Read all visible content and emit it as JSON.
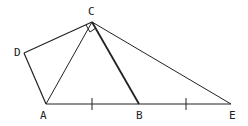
{
  "diagram": {
    "type": "geometry",
    "points": {
      "A": {
        "label": "A",
        "x": 46,
        "y": 104,
        "lx": 42,
        "ly": 119
      },
      "B": {
        "label": "B",
        "x": 139,
        "y": 104,
        "lx": 136,
        "ly": 119
      },
      "C": {
        "label": "C",
        "x": 92,
        "y": 22,
        "lx": 88,
        "ly": 15
      },
      "D": {
        "label": "D",
        "x": 24,
        "y": 53,
        "lx": 14,
        "ly": 56
      },
      "E": {
        "label": "E",
        "x": 231,
        "y": 104,
        "lx": 229,
        "ly": 119
      }
    },
    "segments": [
      "AD",
      "DC",
      "CA",
      "CB",
      "CE",
      "AE"
    ],
    "bold_segments": [
      "CB"
    ],
    "tick_marks": [
      "AB",
      "BE"
    ],
    "right_angle_at": "C",
    "stroke_color": "#222222"
  }
}
